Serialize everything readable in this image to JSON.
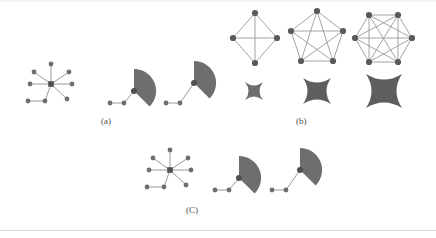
{
  "figure": {
    "background_color": "#ffffff",
    "page_color": "#f2f2f2",
    "node_color": "#6e6e6e",
    "edge_color": "#9a9a9a",
    "shape_fill": "#6e6e6e",
    "caption_color": "#4a4a4a",
    "captions": {
      "a": "(a)",
      "b": "(b)",
      "c": "(C)"
    },
    "panels": [
      {
        "id": "panel-a",
        "caption": "(a)",
        "items": [
          {
            "type": "star-graph",
            "name": "star-graph-7-spokes",
            "spokes": 7,
            "center": [
              51,
              84
            ],
            "radius": 20
          },
          {
            "type": "fan-with-path",
            "name": "fan-shape-small",
            "path_nodes": 3,
            "fan_radius": 19
          },
          {
            "type": "fan-with-path",
            "name": "fan-shape-elevated",
            "path_nodes": 3,
            "fan_radius": 19
          }
        ]
      },
      {
        "id": "panel-b",
        "caption": "(b)",
        "items": [
          {
            "type": "complete-graph",
            "name": "complete-graph-k4",
            "vertices": 4,
            "edges": 6,
            "layout": "diamond",
            "blob_size": 20
          },
          {
            "type": "complete-graph",
            "name": "complete-graph-k5",
            "vertices": 5,
            "edges": 10,
            "layout": "pentagon",
            "blob_size": 28
          },
          {
            "type": "complete-graph",
            "name": "complete-graph-k6",
            "vertices": 6,
            "edges": 15,
            "layout": "hexagon",
            "blob_size": 36
          }
        ]
      },
      {
        "id": "panel-c",
        "caption": "(C)",
        "items": [
          {
            "type": "star-graph",
            "name": "star-graph-7-spokes",
            "spokes": 7,
            "center": [
              170,
              170
            ],
            "radius": 20
          },
          {
            "type": "fan-with-path",
            "name": "fan-shape-small",
            "path_nodes": 3,
            "fan_radius": 19
          },
          {
            "type": "fan-with-path",
            "name": "fan-shape-elevated",
            "path_nodes": 3,
            "fan_radius": 19
          }
        ]
      }
    ]
  }
}
